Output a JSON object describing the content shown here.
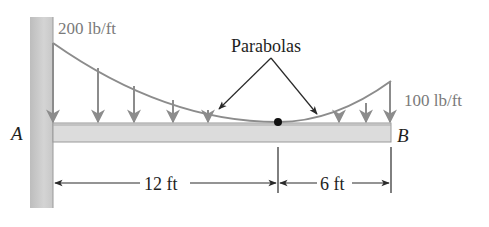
{
  "diagram": {
    "type": "cantilever-beam-distributed-load",
    "labels": {
      "load_left": "200 lb/ft",
      "load_right": "100 lb/ft",
      "curve_annotation": "Parabolas",
      "point_a": "A",
      "point_b": "B",
      "dim_left": "12 ft",
      "dim_right": "6 ft"
    },
    "geometry": {
      "segments_ft": [
        12,
        6
      ],
      "load_at_A_lb_per_ft": 200,
      "load_at_B_lb_per_ft": 100,
      "load_at_junction_lb_per_ft": 0,
      "load_shape": "two parabolic arcs meeting at minimum (vertex) 12 ft from A"
    },
    "colors": {
      "wall_fill": "#cfcfcf",
      "beam_fill": "#dcdcdc",
      "beam_edge": "#9a9a9a",
      "load_curve": "#8c8c8c",
      "load_arrows": "#8c8c8c",
      "dimension_lines": "#2a2a2a",
      "text_dark": "#1e1e1e",
      "text_load": "#7a7a7a"
    }
  }
}
